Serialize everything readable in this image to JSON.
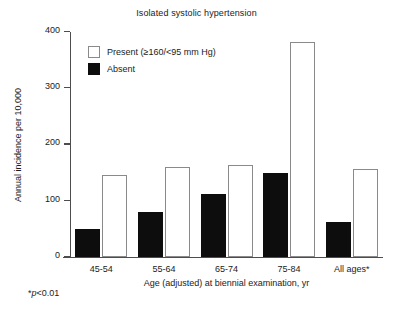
{
  "chart_data": {
    "type": "bar",
    "title": "Isolated systolic hypertension",
    "xlabel": "Age (adjusted) at biennial examination, yr",
    "ylabel": "Annual incidence per 10,000",
    "categories": [
      "45-54",
      "55-64",
      "65-74",
      "75-84",
      "All ages*"
    ],
    "series": [
      {
        "name": "Absent",
        "color": "#0d0d0d",
        "values": [
          50,
          80,
          112,
          150,
          62
        ]
      },
      {
        "name": "Present (≥160/<95 mm Hg)",
        "color": "#ffffff",
        "values": [
          146,
          160,
          163,
          382,
          157
        ]
      }
    ],
    "ylim": [
      0,
      400
    ],
    "yticks": [
      0,
      100,
      200,
      300,
      400
    ],
    "ytick_labels": [
      "0",
      "100",
      "200",
      "300",
      "400"
    ],
    "grid": false,
    "legend_position": "upper left",
    "annotations": [
      "*p<0.01"
    ]
  },
  "legend": {
    "entries": [
      {
        "label": "Present (≥160/<95 mm Hg)",
        "swatch": "present"
      },
      {
        "label": "Absent",
        "swatch": "absent"
      }
    ]
  },
  "footnote": {
    "marker": "*",
    "italic_text": "p",
    "rest": "<0.01"
  }
}
